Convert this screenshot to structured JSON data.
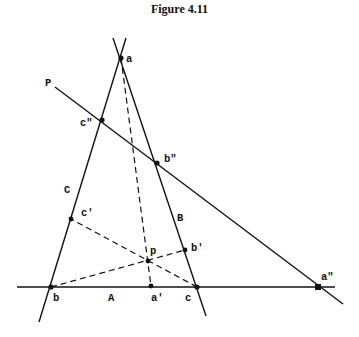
{
  "figure": {
    "title": "Figure 4.11"
  },
  "lines": {
    "A": {
      "label": "A",
      "from": [
        17,
        287
      ],
      "to": [
        335,
        287
      ],
      "style": "solid"
    },
    "B": {
      "label": "B",
      "from": [
        113,
        38
      ],
      "to": [
        206,
        316
      ],
      "style": "solid"
    },
    "C": {
      "label": "C",
      "from": [
        126,
        38
      ],
      "to": [
        39,
        322
      ],
      "style": "solid"
    },
    "P": {
      "label": "P",
      "from": [
        55,
        87
      ],
      "to": [
        343,
        304
      ],
      "style": "solid"
    }
  },
  "dashed_lines": [
    {
      "from": "a",
      "to": "a'"
    },
    {
      "from": "b",
      "to": "b'"
    },
    {
      "from": "c",
      "to": "c'"
    }
  ],
  "points": {
    "a": {
      "label": "a",
      "x": 121,
      "y": 58
    },
    "b": {
      "label": "b",
      "x": 51,
      "y": 287
    },
    "c": {
      "label": "c",
      "x": 197,
      "y": 287
    },
    "a1": {
      "label": "a'",
      "x": 151,
      "y": 286
    },
    "b1": {
      "label": "b'",
      "x": 185,
      "y": 250
    },
    "c1": {
      "label": "c'",
      "x": 71,
      "y": 219
    },
    "a2": {
      "label": "a\"",
      "x": 318,
      "y": 287
    },
    "b2": {
      "label": "b\"",
      "x": 157,
      "y": 163
    },
    "c2": {
      "label": "c\"",
      "x": 102,
      "y": 120
    },
    "p": {
      "label": "p",
      "x": 148,
      "y": 261
    }
  },
  "colors": {
    "ink": "#111111",
    "background": "#ffffff"
  }
}
